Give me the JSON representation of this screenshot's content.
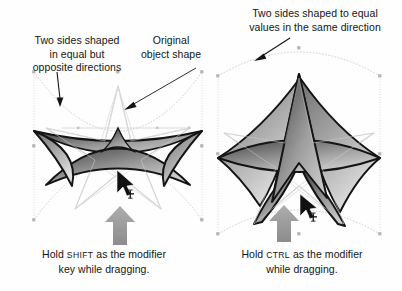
{
  "figure": {
    "background_color": "#fefefe"
  },
  "annotations": {
    "left_shape_label": "Two sides shaped\nin equal but\nopposite directions",
    "left_shape_label_lines": [
      "Two sides shaped",
      "in equal but",
      "opposite directions"
    ],
    "original_shape_label_lines": [
      "Original",
      "object shape"
    ],
    "right_shape_label_lines": [
      "Two sides shaped to equal",
      "values in the same direction"
    ]
  },
  "captions": {
    "left": {
      "prefix": "Hold ",
      "key": "SHIFT",
      "suffix": " as the modifier",
      "line2": "key while dragging."
    },
    "right": {
      "prefix": "Hold ",
      "key": "CTRL",
      "suffix": " as the modifier",
      "line2": "while dragging."
    }
  },
  "panels": [
    {
      "id": "left-panel",
      "modifier_key": "SHIFT",
      "effect": "opposite directions",
      "shape": "five-pointed-star",
      "distortion": "two sides bowed in equal but opposite directions",
      "cursor": {
        "x": 118,
        "y": 182,
        "type": "arrow-with-move-crosshair"
      },
      "drag_arrow": {
        "x": 120,
        "y": 222,
        "direction": "up",
        "color": "#9a9a9a"
      },
      "bounding_box": {
        "x": 34,
        "y": 72,
        "width": 168,
        "height": 148
      }
    },
    {
      "id": "right-panel",
      "modifier_key": "CTRL",
      "effect": "same direction",
      "shape": "five-pointed-star",
      "distortion": "two sides bowed to equal values in the same direction",
      "cursor": {
        "x": 301,
        "y": 200,
        "type": "arrow-with-move-crosshair"
      },
      "drag_arrow": {
        "x": 283,
        "y": 218,
        "direction": "up",
        "color": "#9a9a9a"
      },
      "bounding_box": {
        "x": 216,
        "y": 58,
        "width": 164,
        "height": 178
      }
    }
  ],
  "colors": {
    "stroke_dark": "#141414",
    "fill_gradient_dark": "#555555",
    "fill_gradient_light": "#c9c9c9",
    "ghost_outline": "#c7c7c7",
    "guide_line": "#d2d2d2",
    "handle": "#b0b0b0",
    "drag_arrow": "#9a9a9a",
    "text": "#141414"
  },
  "icons": {
    "drag_arrow": "arrow-up-icon",
    "cursor": "mouse-pointer-icon",
    "move_badge": "move-crosshair-icon",
    "pointer_line": "leader-line-arrow-icon"
  }
}
